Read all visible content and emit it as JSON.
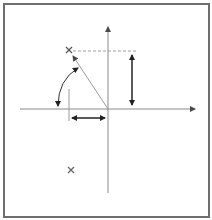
{
  "diagram": {
    "colors": {
      "frame": "#6e6e6e",
      "axis": "#8a8a8a",
      "vector": "#9a9a9a",
      "dashed": "#a0a0a0",
      "dimension_arrow": "#333333",
      "marker": "#555555"
    },
    "markers": [
      {
        "name": "point-upper",
        "glyph": "x"
      },
      {
        "name": "point-lower",
        "glyph": "x"
      }
    ],
    "elements": {
      "x_axis": "horizontal-axis",
      "y_axis": "vertical-axis",
      "vector": "origin-to-point",
      "vertical_component": "double-arrow",
      "horizontal_component": "double-arrow",
      "angle": "arc-with-arrowheads",
      "projection": "dashed-line"
    }
  }
}
